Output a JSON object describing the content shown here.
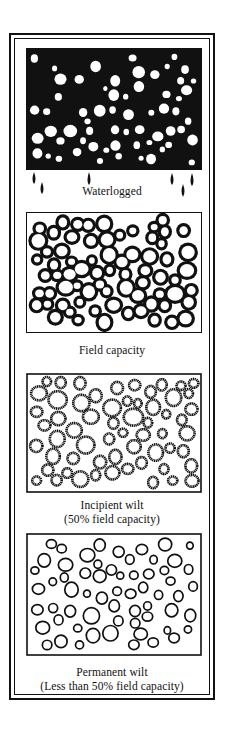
{
  "figure": {
    "panels": [
      {
        "id": "waterlogged",
        "label_lines": [
          "Waterlogged"
        ],
        "style": "solid-black-with-white-pores"
      },
      {
        "id": "field-capacity",
        "label_lines": [
          "Field capacity"
        ],
        "style": "black-films-around-particles"
      },
      {
        "id": "incipient-wilt",
        "label_lines": [
          "Incipient wilt",
          "(50% field capacity)"
        ],
        "style": "fuzzy-rings"
      },
      {
        "id": "permanent-wilt",
        "label_lines": [
          "Permanent wilt",
          "(Less than 50% field capacity)"
        ],
        "style": "thin-rings"
      }
    ],
    "colors": {
      "ink": "#111111",
      "paper": "#ffffff"
    }
  }
}
